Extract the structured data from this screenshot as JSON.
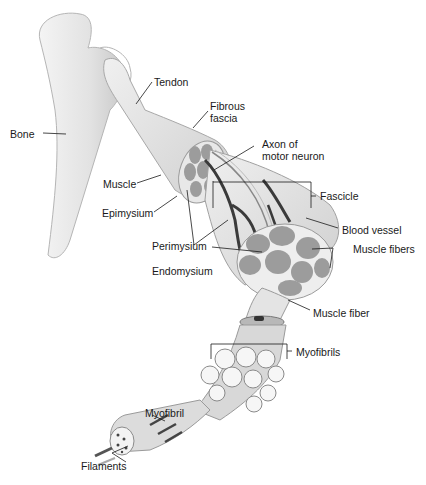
{
  "diagram": {
    "colors": {
      "bone": "#e6e6e6",
      "muscle": "#dcdcdc",
      "fascicle_fill": "#9c9c9c",
      "vessel": "#3a3a3a",
      "outline": "#8a8a8a",
      "label_text": "#1a1a1a"
    },
    "labels": {
      "tendon": "Tendon",
      "bone": "Bone",
      "fibrous_fascia": "Fibrous\nfascia",
      "axon": "Axon of\nmotor neuron",
      "muscle": "Muscle",
      "fascicle": "Fascicle",
      "epimysium": "Epimysium",
      "blood_vessel": "Blood vessel",
      "perimysium": "Perimysium",
      "muscle_fibers": "Muscle fibers",
      "endomysium": "Endomysium",
      "muscle_fiber": "Muscle fiber",
      "myofibrils": "Myofibrils",
      "myofibril": "Myofibril",
      "filaments": "Filaments"
    }
  }
}
